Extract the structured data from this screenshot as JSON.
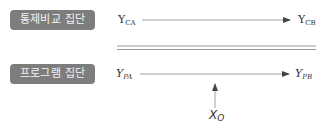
{
  "groups": {
    "control": {
      "label": "통제비교 집단",
      "pre": {
        "main": "Y",
        "sub": "CA"
      },
      "post": {
        "main": "Y",
        "sub": "CB"
      }
    },
    "program": {
      "label": "프로그램 집단",
      "pre": {
        "main": "Y",
        "sub": "PA"
      },
      "post": {
        "main": "Y",
        "sub": "PB"
      }
    }
  },
  "treatment": {
    "main": "X",
    "sub": "O"
  },
  "colors": {
    "box_bg": "#7d7d7d",
    "box_text": "#f4f4f4",
    "line": "#555555",
    "divider": "#9a9a9a"
  }
}
